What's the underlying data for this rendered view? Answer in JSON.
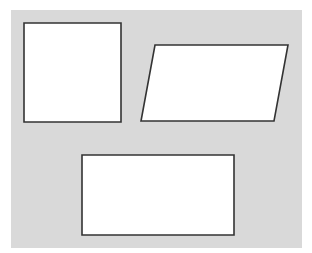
{
  "diagram": {
    "background_color": "#d9d9d9",
    "shape_fill": "#ffffff",
    "stroke_color": "#333333",
    "shapes": [
      {
        "type": "square",
        "points": "24,23 121,23 121,122 24,122"
      },
      {
        "type": "parallelogram",
        "points": "155,45 288,45 274,121 141,121"
      },
      {
        "type": "rectangle",
        "points": "82,155 234,155 234,235 82,235"
      }
    ]
  }
}
